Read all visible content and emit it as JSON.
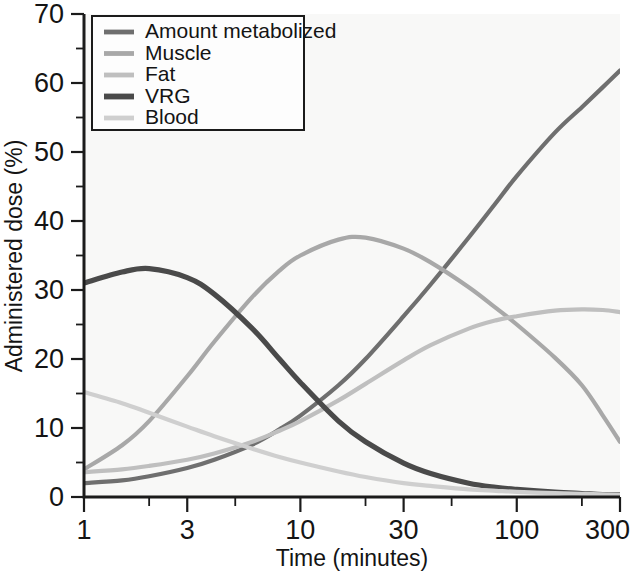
{
  "chart_data": {
    "type": "line",
    "title": "",
    "xlabel": "Time (minutes)",
    "ylabel": "Administered dose (%)",
    "xscale": "log",
    "xlim": [
      1,
      300
    ],
    "ylim": [
      0,
      70
    ],
    "ytick_step": 10,
    "yminor_step": 5,
    "grid": false,
    "legend_position": "top-left",
    "xticklabels": [
      "1",
      "3",
      "10",
      "30",
      "100",
      "300"
    ],
    "xtickvalues": [
      1,
      3,
      10,
      30,
      100,
      300
    ],
    "yticklabels": [
      "0",
      "10",
      "20",
      "30",
      "40",
      "50",
      "60",
      "70"
    ],
    "ytickvalues": [
      0,
      10,
      20,
      30,
      40,
      50,
      60,
      70
    ],
    "series": [
      {
        "name": "Amount metabolized",
        "color": "#6f6f6f",
        "width": 4.2,
        "x": [
          1,
          1.5,
          2,
          3,
          4,
          6,
          8,
          10,
          15,
          20,
          30,
          40,
          60,
          80,
          100,
          150,
          200,
          250,
          300
        ],
        "y": [
          2,
          2.4,
          3,
          4.2,
          5.4,
          7.6,
          9.8,
          11.8,
          16.2,
          20.0,
          26.2,
          30.8,
          37.6,
          42.6,
          46.5,
          52.8,
          56.5,
          59.4,
          61.8
        ]
      },
      {
        "name": "Muscle",
        "color": "#a8a8a8",
        "width": 4.2,
        "x": [
          1,
          1.5,
          2,
          3,
          4,
          6,
          8,
          10,
          15,
          20,
          30,
          40,
          60,
          80,
          100,
          150,
          200,
          250,
          300
        ],
        "y": [
          4.0,
          7.5,
          11.0,
          17.5,
          22.5,
          29.0,
          32.8,
          35.0,
          37.3,
          37.6,
          36.0,
          34.0,
          30.4,
          27.4,
          25.0,
          20.2,
          16.2,
          11.8,
          8.0
        ]
      },
      {
        "name": "Fat",
        "color": "#bfbfbf",
        "width": 4.2,
        "x": [
          1,
          1.5,
          2,
          3,
          4,
          6,
          8,
          10,
          15,
          20,
          30,
          40,
          60,
          80,
          100,
          150,
          200,
          250,
          300
        ],
        "y": [
          3.6,
          4.0,
          4.5,
          5.4,
          6.3,
          8.0,
          9.6,
          11.0,
          14.0,
          16.4,
          19.8,
          22.0,
          24.4,
          25.6,
          26.2,
          27.0,
          27.2,
          27.1,
          26.8
        ]
      },
      {
        "name": "VRG",
        "color": "#4a4a4a",
        "width": 5.2,
        "x": [
          1,
          1.5,
          2,
          3,
          4,
          6,
          8,
          10,
          15,
          20,
          30,
          40,
          60,
          80,
          100,
          150,
          200,
          250,
          300
        ],
        "y": [
          31.0,
          32.6,
          33.1,
          31.8,
          29.4,
          24.4,
          20.0,
          16.6,
          11.0,
          8.0,
          4.9,
          3.4,
          2.0,
          1.4,
          1.1,
          0.7,
          0.5,
          0.35,
          0.3
        ]
      },
      {
        "name": "Blood",
        "color": "#cfcfcf",
        "width": 4.2,
        "x": [
          1,
          1.5,
          2,
          3,
          4,
          6,
          8,
          10,
          15,
          20,
          30,
          40,
          60,
          80,
          100,
          150,
          200,
          250,
          300
        ],
        "y": [
          15.2,
          13.6,
          12.2,
          10.2,
          8.8,
          7.0,
          5.8,
          5.0,
          3.7,
          2.9,
          2.0,
          1.6,
          1.1,
          0.9,
          0.75,
          0.55,
          0.45,
          0.38,
          0.32
        ]
      }
    ]
  },
  "legend": {
    "items": [
      {
        "label": "Amount metabolized"
      },
      {
        "label": "Muscle"
      },
      {
        "label": "Fat"
      },
      {
        "label": "VRG"
      },
      {
        "label": "Blood"
      }
    ]
  }
}
